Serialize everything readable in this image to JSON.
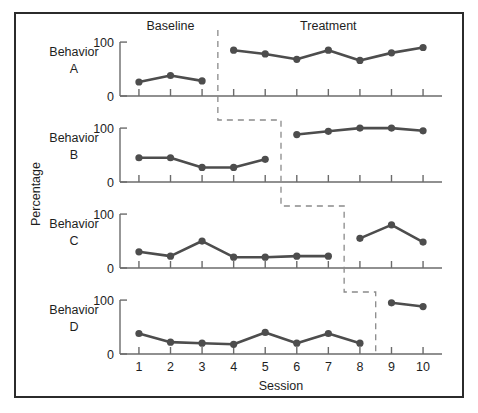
{
  "chart_data": {
    "type": "line",
    "title": "",
    "xlabel": "Session",
    "ylabel": "Percentage",
    "x": [
      1,
      2,
      3,
      4,
      5,
      6,
      7,
      8,
      9,
      10
    ],
    "xlim": [
      0.4,
      10.6
    ],
    "ylim": [
      0,
      115
    ],
    "yticks": [
      0,
      100
    ],
    "ytick_labels": [
      "0",
      "100"
    ],
    "xtick_labels": [
      "1",
      "2",
      "3",
      "4",
      "5",
      "6",
      "7",
      "8",
      "9",
      "10"
    ],
    "grid": false,
    "legend": "none",
    "phase_labels": [
      {
        "text": "Baseline",
        "x": 2.0,
        "panel": 0
      },
      {
        "text": "Treatment",
        "x": 7.0,
        "panel": 0
      }
    ],
    "panels": [
      {
        "name": "Behavior A",
        "label_line1": "Behavior",
        "label_line2": "A",
        "phase_change_after": 3,
        "baseline": {
          "x": [
            1,
            2,
            3
          ],
          "values": [
            26,
            38,
            28
          ]
        },
        "treatment": {
          "x": [
            4,
            5,
            6,
            7,
            8,
            9,
            10
          ],
          "values": [
            85,
            78,
            68,
            85,
            66,
            80,
            90
          ]
        }
      },
      {
        "name": "Behavior B",
        "label_line1": "Behavior",
        "label_line2": "B",
        "phase_change_after": 5,
        "baseline": {
          "x": [
            1,
            2,
            3,
            4,
            5
          ],
          "values": [
            45,
            45,
            27,
            27,
            42
          ]
        },
        "treatment": {
          "x": [
            6,
            7,
            8,
            9,
            10
          ],
          "values": [
            88,
            94,
            100,
            100,
            95
          ]
        }
      },
      {
        "name": "Behavior C",
        "label_line1": "Behavior",
        "label_line2": "C",
        "phase_change_after": 7,
        "baseline": {
          "x": [
            1,
            2,
            3,
            4,
            5,
            6,
            7
          ],
          "values": [
            30,
            22,
            50,
            20,
            20,
            22,
            22
          ]
        },
        "treatment": {
          "x": [
            8,
            9,
            10
          ],
          "values": [
            55,
            80,
            48
          ]
        }
      },
      {
        "name": "Behavior D",
        "label_line1": "Behavior",
        "label_line2": "D",
        "phase_change_after": 8,
        "baseline": {
          "x": [
            1,
            2,
            3,
            4,
            5,
            6,
            7,
            8
          ],
          "values": [
            38,
            22,
            20,
            18,
            40,
            20,
            38,
            20
          ]
        },
        "treatment": {
          "x": [
            9,
            10
          ],
          "values": [
            95,
            88
          ]
        }
      }
    ],
    "colors": {
      "series": "#4d4d4d",
      "axis": "#6b6b6b",
      "phase_line": "#8a8a8a",
      "border": "#2b2b2b",
      "text": "#1e1e1e",
      "background": "#ffffff"
    }
  }
}
